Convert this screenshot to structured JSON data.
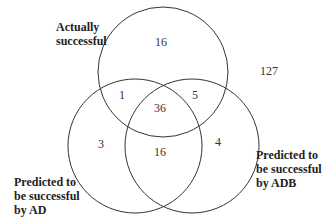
{
  "venn": {
    "sets": [
      {
        "name": "actually-successful",
        "label": "Actually\nsuccessful"
      },
      {
        "name": "predicted-ad",
        "label": "Predicted to\nbe successful\nby AD"
      },
      {
        "name": "predicted-adb",
        "label": "Predicted to\nbe successful\nby ADB"
      }
    ],
    "regions": {
      "actual_only": "16",
      "actual_and_ad": "1",
      "actual_and_adb": "5",
      "all_three": "36",
      "ad_only": "3",
      "ad_and_adb": "16",
      "adb_only": "4",
      "outside": "127"
    }
  }
}
